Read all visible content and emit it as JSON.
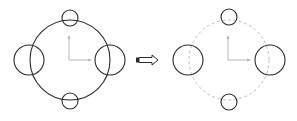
{
  "diagram": {
    "type": "cad-transformation",
    "colors": {
      "stroke": "#2a2a2a",
      "axis": "#b8b8b8",
      "dashed": "#bdbdbd",
      "background": "#ffffff"
    },
    "before": {
      "main_circle": {
        "cx": 70,
        "cy": 60,
        "r": 40,
        "style": "solid"
      },
      "small_circles": [
        {
          "cx": 70,
          "cy": 18,
          "r": 8
        },
        {
          "cx": 70,
          "cy": 101,
          "r": 8
        },
        {
          "cx": 29,
          "cy": 60,
          "r": 15
        },
        {
          "cx": 110,
          "cy": 60,
          "r": 15
        }
      ],
      "axis_origin": {
        "x": 69,
        "y": 60
      }
    },
    "arrow": {
      "glyph": "⇨",
      "x1": 136,
      "x2": 158,
      "y": 60
    },
    "after": {
      "main_circle": {
        "cx": 229,
        "cy": 60,
        "r": 40,
        "style": "dashed"
      },
      "small_circles": [
        {
          "cx": 229,
          "cy": 17,
          "r": 8
        },
        {
          "cx": 229,
          "cy": 102,
          "r": 8
        },
        {
          "cx": 188,
          "cy": 60,
          "r": 15
        },
        {
          "cx": 270,
          "cy": 60,
          "r": 15
        }
      ],
      "axis_origin": {
        "x": 228,
        "y": 60
      }
    }
  }
}
